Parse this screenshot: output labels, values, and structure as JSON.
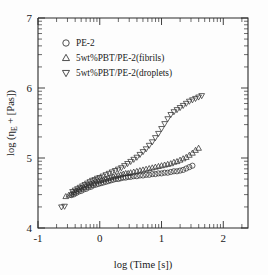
{
  "chart_data": {
    "type": "scatter",
    "title": "",
    "xlabel": "log (Time [s])",
    "ylabel": "log (η_E + [Pas])",
    "ylabel_parts": {
      "pre": "log (",
      "eta": "η",
      "sub": "E",
      "post": " + [Pas])"
    },
    "xlim": [
      -1,
      2.4
    ],
    "ylim": [
      4,
      7
    ],
    "xticks": [
      -1,
      0,
      1,
      2
    ],
    "xticklabels": [
      "-1",
      "0",
      "1",
      "2"
    ],
    "yticks": [
      4,
      5,
      6,
      7
    ],
    "yticklabels": [
      "4",
      "5",
      "6",
      "7"
    ],
    "minor_ticks": "log-decade sub-ticks on both axes",
    "grid": false,
    "legend_position": "upper-left-inside",
    "marker_style": "open markers, no connecting line",
    "series": [
      {
        "name": "PE-2",
        "marker": "circle",
        "points": [
          [
            -0.46,
            4.47
          ],
          [
            -0.42,
            4.48
          ],
          [
            -0.38,
            4.5
          ],
          [
            -0.34,
            4.52
          ],
          [
            -0.3,
            4.53
          ],
          [
            -0.26,
            4.55
          ],
          [
            -0.22,
            4.56
          ],
          [
            -0.18,
            4.58
          ],
          [
            -0.14,
            4.59
          ],
          [
            -0.1,
            4.61
          ],
          [
            -0.06,
            4.62
          ],
          [
            -0.02,
            4.63
          ],
          [
            0.02,
            4.64
          ],
          [
            0.06,
            4.65
          ],
          [
            0.1,
            4.66
          ],
          [
            0.14,
            4.67
          ],
          [
            0.18,
            4.68
          ],
          [
            0.22,
            4.69
          ],
          [
            0.26,
            4.7
          ],
          [
            0.3,
            4.7
          ],
          [
            0.34,
            4.71
          ],
          [
            0.38,
            4.72
          ],
          [
            0.42,
            4.72
          ],
          [
            0.46,
            4.73
          ],
          [
            0.5,
            4.73
          ],
          [
            0.55,
            4.74
          ],
          [
            0.6,
            4.74
          ],
          [
            0.65,
            4.75
          ],
          [
            0.7,
            4.75
          ],
          [
            0.75,
            4.76
          ],
          [
            0.8,
            4.76
          ],
          [
            0.85,
            4.77
          ],
          [
            0.9,
            4.77
          ],
          [
            0.95,
            4.78
          ],
          [
            1.0,
            4.78
          ],
          [
            1.05,
            4.79
          ],
          [
            1.1,
            4.79
          ],
          [
            1.15,
            4.8
          ],
          [
            1.2,
            4.81
          ],
          [
            1.25,
            4.81
          ],
          [
            1.3,
            4.82
          ],
          [
            1.35,
            4.83
          ],
          [
            1.4,
            4.85
          ],
          [
            1.45,
            4.87
          ],
          [
            1.5,
            4.89
          ]
        ]
      },
      {
        "name": "5wt%PBT/PE-2(fibrils)",
        "marker": "triangle-up",
        "points": [
          [
            -0.55,
            4.45
          ],
          [
            -0.5,
            4.47
          ],
          [
            -0.46,
            4.49
          ],
          [
            -0.42,
            4.51
          ],
          [
            -0.38,
            4.53
          ],
          [
            -0.34,
            4.55
          ],
          [
            -0.3,
            4.57
          ],
          [
            -0.26,
            4.58
          ],
          [
            -0.22,
            4.6
          ],
          [
            -0.18,
            4.61
          ],
          [
            -0.14,
            4.63
          ],
          [
            -0.1,
            4.64
          ],
          [
            -0.06,
            4.66
          ],
          [
            -0.02,
            4.67
          ],
          [
            0.02,
            4.68
          ],
          [
            0.06,
            4.69
          ],
          [
            0.1,
            4.7
          ],
          [
            0.14,
            4.71
          ],
          [
            0.18,
            4.72
          ],
          [
            0.22,
            4.73
          ],
          [
            0.26,
            4.74
          ],
          [
            0.3,
            4.75
          ],
          [
            0.34,
            4.76
          ],
          [
            0.38,
            4.77
          ],
          [
            0.42,
            4.78
          ],
          [
            0.46,
            4.78
          ],
          [
            0.5,
            4.79
          ],
          [
            0.55,
            4.8
          ],
          [
            0.6,
            4.81
          ],
          [
            0.65,
            4.82
          ],
          [
            0.7,
            4.83
          ],
          [
            0.75,
            4.84
          ],
          [
            0.8,
            4.85
          ],
          [
            0.85,
            4.86
          ],
          [
            0.9,
            4.87
          ],
          [
            0.95,
            4.88
          ],
          [
            1.0,
            4.89
          ],
          [
            1.05,
            4.9
          ],
          [
            1.1,
            4.91
          ],
          [
            1.15,
            4.92
          ],
          [
            1.2,
            4.94
          ],
          [
            1.25,
            4.95
          ],
          [
            1.3,
            4.97
          ],
          [
            1.35,
            4.99
          ],
          [
            1.4,
            5.01
          ],
          [
            1.45,
            5.04
          ],
          [
            1.5,
            5.07
          ],
          [
            1.55,
            5.11
          ],
          [
            1.6,
            5.14
          ]
        ]
      },
      {
        "name": "5wt%PBT/PE-2(droplets)",
        "marker": "triangle-down",
        "points": [
          [
            -0.62,
            4.3
          ],
          [
            -0.57,
            4.31
          ],
          [
            -0.44,
            4.52
          ],
          [
            -0.4,
            4.54
          ],
          [
            -0.36,
            4.56
          ],
          [
            -0.32,
            4.58
          ],
          [
            -0.28,
            4.6
          ],
          [
            -0.24,
            4.62
          ],
          [
            -0.2,
            4.64
          ],
          [
            -0.16,
            4.66
          ],
          [
            -0.12,
            4.68
          ],
          [
            -0.08,
            4.69
          ],
          [
            -0.04,
            4.71
          ],
          [
            0.0,
            4.72
          ],
          [
            0.05,
            4.74
          ],
          [
            0.1,
            4.76
          ],
          [
            0.15,
            4.78
          ],
          [
            0.2,
            4.8
          ],
          [
            0.25,
            4.82
          ],
          [
            0.3,
            4.84
          ],
          [
            0.35,
            4.86
          ],
          [
            0.4,
            4.89
          ],
          [
            0.45,
            4.92
          ],
          [
            0.5,
            4.95
          ],
          [
            0.55,
            4.98
          ],
          [
            0.6,
            5.01
          ],
          [
            0.65,
            5.05
          ],
          [
            0.7,
            5.09
          ],
          [
            0.75,
            5.13
          ],
          [
            0.8,
            5.18
          ],
          [
            0.85,
            5.23
          ],
          [
            0.9,
            5.29
          ],
          [
            0.95,
            5.35
          ],
          [
            1.0,
            5.42
          ],
          [
            1.05,
            5.49
          ],
          [
            1.1,
            5.56
          ],
          [
            1.15,
            5.62
          ],
          [
            1.2,
            5.66
          ],
          [
            1.25,
            5.69
          ],
          [
            1.3,
            5.72
          ],
          [
            1.35,
            5.75
          ],
          [
            1.4,
            5.78
          ],
          [
            1.45,
            5.81
          ],
          [
            1.5,
            5.83
          ],
          [
            1.55,
            5.85
          ],
          [
            1.6,
            5.87
          ],
          [
            1.65,
            5.89
          ]
        ]
      }
    ],
    "legend": [
      {
        "label": "PE-2",
        "marker": "circle"
      },
      {
        "label": "5wt%PBT/PE-2(fibrils)",
        "marker": "triangle-up"
      },
      {
        "label": "5wt%PBT/PE-2(droplets)",
        "marker": "triangle-down"
      }
    ]
  }
}
